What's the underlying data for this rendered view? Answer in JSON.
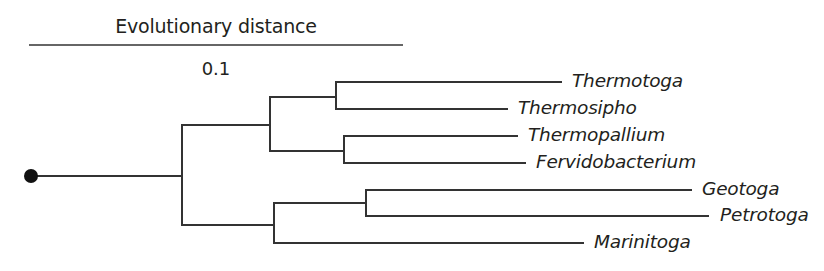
{
  "scale_bar": {
    "title": "Evolutionary distance",
    "value": "0.1",
    "x1": 29,
    "x2": 403,
    "y": 45
  },
  "style": {
    "line_color": "#333333",
    "root_color": "#111111",
    "text_color": "#231f20"
  },
  "root": {
    "cx": 31,
    "cy": 176,
    "r": 7
  },
  "branches": [
    {
      "id": "root-stem",
      "x1": 31,
      "y1": 176,
      "x2": 182,
      "y2": 176
    },
    {
      "id": "root-node-vertical",
      "x1": 182,
      "y1": 125,
      "x2": 182,
      "y2": 225
    },
    {
      "id": "upper-clade-stem",
      "x1": 182,
      "y1": 125,
      "x2": 270,
      "y2": 125
    },
    {
      "id": "upper-clade-vertical",
      "x1": 270,
      "y1": 97,
      "x2": 270,
      "y2": 151
    },
    {
      "id": "thermotoga-group-stem",
      "x1": 270,
      "y1": 97,
      "x2": 336,
      "y2": 97
    },
    {
      "id": "thermotoga-group-vertical",
      "x1": 336,
      "y1": 82,
      "x2": 336,
      "y2": 109
    },
    {
      "id": "thermotoga-tip",
      "x1": 336,
      "y1": 82,
      "x2": 561,
      "y2": 82
    },
    {
      "id": "thermosipho-tip",
      "x1": 336,
      "y1": 109,
      "x2": 507,
      "y2": 109
    },
    {
      "id": "fervido-group-stem",
      "x1": 270,
      "y1": 151,
      "x2": 344,
      "y2": 151
    },
    {
      "id": "fervido-group-vertical",
      "x1": 344,
      "y1": 136,
      "x2": 344,
      "y2": 163
    },
    {
      "id": "thermopallium-tip",
      "x1": 344,
      "y1": 136,
      "x2": 517,
      "y2": 136
    },
    {
      "id": "fervidobacterium-tip",
      "x1": 344,
      "y1": 163,
      "x2": 525,
      "y2": 163
    },
    {
      "id": "lower-clade-stem",
      "x1": 182,
      "y1": 225,
      "x2": 274,
      "y2": 225
    },
    {
      "id": "lower-clade-vertical",
      "x1": 274,
      "y1": 203,
      "x2": 274,
      "y2": 243
    },
    {
      "id": "petrotoga-group-stem",
      "x1": 274,
      "y1": 203,
      "x2": 366,
      "y2": 203
    },
    {
      "id": "petrotoga-group-vertical",
      "x1": 366,
      "y1": 190,
      "x2": 366,
      "y2": 216
    },
    {
      "id": "geotoga-tip",
      "x1": 366,
      "y1": 190,
      "x2": 691,
      "y2": 190
    },
    {
      "id": "petrotoga-tip",
      "x1": 366,
      "y1": 216,
      "x2": 708,
      "y2": 216
    },
    {
      "id": "marinitoga-tip",
      "x1": 274,
      "y1": 243,
      "x2": 583,
      "y2": 243
    }
  ],
  "taxa": [
    {
      "name": "Thermotoga",
      "x": 572,
      "y": 82
    },
    {
      "name": "Thermosipho",
      "x": 518,
      "y": 109
    },
    {
      "name": "Thermopallium",
      "x": 528,
      "y": 136
    },
    {
      "name": "Fervidobacterium",
      "x": 536,
      "y": 163
    },
    {
      "name": "Geotoga",
      "x": 702,
      "y": 190
    },
    {
      "name": "Petrotoga",
      "x": 720,
      "y": 216
    },
    {
      "name": "Marinitoga",
      "x": 594,
      "y": 243
    }
  ]
}
